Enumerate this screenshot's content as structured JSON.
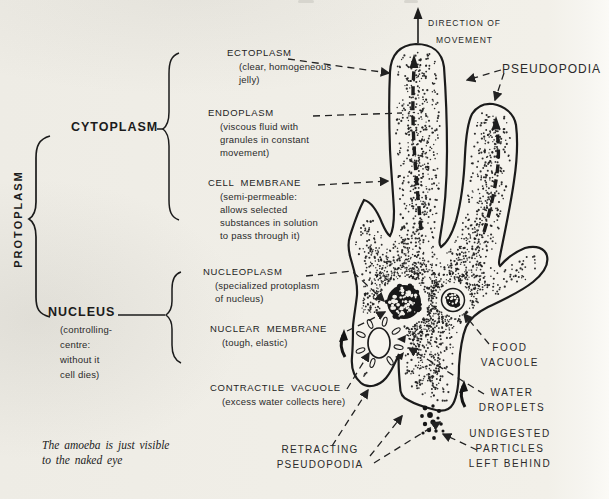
{
  "page": {
    "paper_color": "#f2f0e9",
    "ink_color": "#1d1d1d"
  },
  "left_panel": {
    "protoplasm": "PROTOPLASM",
    "cytoplasm": "CYTOPLASM",
    "nucleus": {
      "title": "NUCLEUS",
      "sub": [
        "(controlling-",
        "centre:",
        "without it",
        "cell dies)"
      ]
    },
    "caption": [
      "The amoeba is just visible",
      "to the naked eye"
    ]
  },
  "cytoplasm_labels": {
    "ectoplasm": {
      "title": "ECTOPLASM",
      "sub": [
        "(clear, homogeneous",
        "jelly)"
      ]
    },
    "endoplasm": {
      "title": "ENDOPLASM",
      "sub": [
        "(viscous fluid with",
        "granules in constant",
        "movement)"
      ]
    },
    "cell_membrane": {
      "title": "CELL MEMBRANE",
      "sub": [
        "(semi-permeable:",
        "allows selected",
        "substances in solution",
        "to pass through it)"
      ]
    }
  },
  "nucleus_labels": {
    "nucleoplasm": {
      "title": "NUCLEOPLASM",
      "sub": [
        "(specialized protoplasm",
        "of nucleus)"
      ]
    },
    "nuclear_membrane": {
      "title": "NUCLEAR MEMBRANE",
      "sub": [
        "(tough, elastic)"
      ]
    },
    "contractile_vacuole": {
      "title": "CONTRACTILE VACUOLE",
      "sub": [
        "(excess water collects here)"
      ]
    },
    "retracting_pseudopodia": {
      "lines": [
        "RETRACTING",
        "PSEUDOPODIA"
      ]
    }
  },
  "right_labels": {
    "direction_of_movement": {
      "lines": [
        "DIRECTION OF",
        "MOVEMENT"
      ]
    },
    "pseudopodia": "PSEUDOPODIA",
    "food_vacuole": {
      "lines": [
        "FOOD",
        "VACUOLE"
      ]
    },
    "water_droplets": {
      "lines": [
        "WATER",
        "DROPLETS"
      ]
    },
    "undigested_particles": {
      "lines": [
        "UNDIGESTED",
        "PARTICLES",
        "LEFT BEHIND"
      ]
    }
  }
}
